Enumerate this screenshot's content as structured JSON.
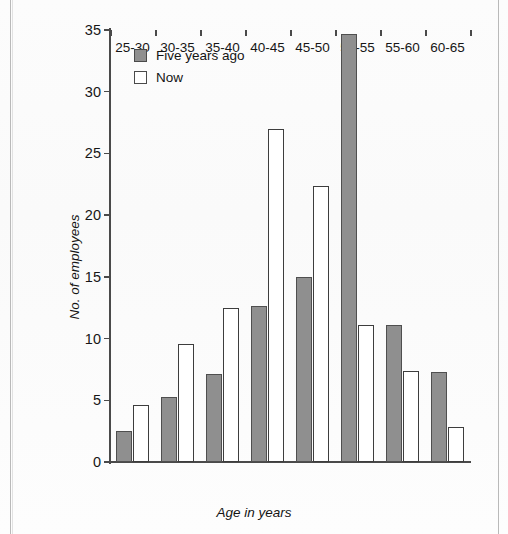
{
  "page": {
    "top_cut_text": ""
  },
  "legend": {
    "position": "inside-top-left",
    "items": [
      {
        "label": "Five years ago",
        "swatch": "filled-gray-square",
        "color": "#8f8f8f"
      },
      {
        "label": "Now",
        "swatch": "empty-white-square",
        "color": "#ffffff"
      }
    ]
  },
  "axis": {
    "y_title": "No. of employees",
    "x_title": "Age in years",
    "y_ticks": [
      0,
      5,
      10,
      15,
      20,
      25,
      30,
      35
    ],
    "x_categories": [
      "25-30",
      "30-35",
      "35-40",
      "40-45",
      "45-50",
      "50-55",
      "55-60",
      "60-65"
    ]
  },
  "chart_data": {
    "type": "bar",
    "title": "",
    "xlabel": "Age in years",
    "ylabel": "No. of employees",
    "categories": [
      "25-30",
      "30-35",
      "35-40",
      "40-45",
      "45-50",
      "50-55",
      "55-60",
      "60-65"
    ],
    "series": [
      {
        "name": "Five years ago",
        "color": "#8f8f8f",
        "values": [
          2.5,
          5.3,
          7.1,
          12.6,
          15.0,
          34.7,
          11.1,
          7.3
        ]
      },
      {
        "name": "Now",
        "color": "#ffffff",
        "values": [
          4.6,
          9.6,
          12.5,
          27.0,
          22.4,
          11.1,
          7.4,
          2.8
        ]
      }
    ],
    "ylim": [
      0,
      35
    ],
    "ytick_step": 5,
    "grid": false,
    "legend_position": "top-left-inside"
  }
}
